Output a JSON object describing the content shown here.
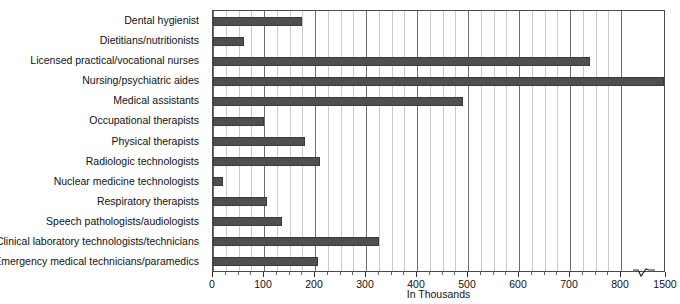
{
  "chart_data": {
    "type": "bar",
    "orientation": "horizontal",
    "title": "",
    "xlabel": "In Thousands",
    "ylabel": "",
    "xlim": [
      0,
      800
    ],
    "grid": true,
    "legend": false,
    "axis_break": {
      "after": 800,
      "resumes_at": 1500,
      "symbol": "zigzag"
    },
    "tick_labels": [
      "0",
      "100",
      "200",
      "300",
      "400",
      "500",
      "600",
      "700",
      "800",
      "1500"
    ],
    "tick_values": [
      0,
      100,
      200,
      300,
      400,
      500,
      600,
      700,
      800,
      1500
    ],
    "minor_gridline_step": 25,
    "bar_color": "#4f4f4f",
    "categories": [
      "Dental hygienist",
      "Dietitians/nutritionists",
      "Licensed practical/vocational nurses",
      "Nursing/psychiatric aides",
      "Medical assistants",
      "Occupational therapists",
      "Physical therapists",
      "Radiologic technologists",
      "Nuclear medicine technologists",
      "Respiratory therapists",
      "Speech pathologists/audiologists",
      "Clinical laboratory technologists/technicians",
      "Emergency medical technicians/paramedics"
    ],
    "values": [
      175,
      60,
      740,
      1500,
      490,
      100,
      180,
      210,
      20,
      105,
      135,
      325,
      205
    ]
  }
}
